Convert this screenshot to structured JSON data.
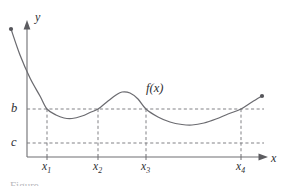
{
  "figure": {
    "caption_partial": "Figure"
  },
  "axes": {
    "y_label": "y",
    "x_label": "x",
    "origin": {
      "x": 27,
      "y": 157
    },
    "x_axis_end": 268,
    "y_axis_top": 22
  },
  "levels": {
    "b": {
      "label": "b",
      "pixel_y": 109
    },
    "c": {
      "label": "c",
      "pixel_y": 143
    }
  },
  "curve": {
    "label": "f(x)",
    "stroke_color": "#6b6b70",
    "endpoint_left": {
      "x": 11,
      "y": 29
    },
    "endpoint_right": {
      "x": 262,
      "y": 96
    }
  },
  "ticks": [
    {
      "label": "x",
      "subscript": "1",
      "pixel_x": 47
    },
    {
      "label": "x",
      "subscript": "2",
      "pixel_x": 98
    },
    {
      "label": "x",
      "subscript": "3",
      "pixel_x": 146
    },
    {
      "label": "x",
      "subscript": "4",
      "pixel_x": 241
    }
  ],
  "colors": {
    "curve": "#6b6b70",
    "axis": "#6e6e72",
    "dashed_guide": "#7a7a7f",
    "label_text": "#2e2e32",
    "background": "#ffffff"
  },
  "chart_data": {
    "type": "line",
    "title": "",
    "xlabel": "x",
    "ylabel": "y",
    "grid": false,
    "legend": "none",
    "annotations": [
      "f(x)"
    ],
    "series": [
      {
        "name": "f(x)",
        "description": "Continuous curve: steep decay from upper left, local minimum below b, local maximum above b, deeper local minimum below b, then rising past b to the right endpoint.",
        "x": [
          11,
          20,
          30,
          40,
          47,
          56,
          64,
          72,
          82,
          90,
          98,
          108,
          116,
          122,
          130,
          138,
          146,
          158,
          170,
          182,
          192,
          204,
          216,
          228,
          241,
          252,
          262
        ],
        "y": [
          29,
          55,
          78,
          96,
          109,
          115,
          118,
          118.5,
          116,
          112.5,
          109,
          101,
          95,
          92,
          93,
          99,
          109,
          117,
          122,
          124.5,
          125,
          123,
          119,
          114,
          109,
          102,
          96
        ]
      }
    ],
    "reference_lines": [
      {
        "label": "b",
        "orientation": "horizontal",
        "pixel_y": 109
      },
      {
        "label": "c",
        "orientation": "horizontal",
        "pixel_y": 143
      }
    ],
    "markers": [
      {
        "label": "x1",
        "pixel_x": 47,
        "note": "f(x1) = b"
      },
      {
        "label": "x2",
        "pixel_x": 98,
        "note": "f(x2) = b"
      },
      {
        "label": "x3",
        "pixel_x": 146,
        "note": "f(x3) = b"
      },
      {
        "label": "x4",
        "pixel_x": 241,
        "note": "f(x4) = b"
      }
    ]
  }
}
